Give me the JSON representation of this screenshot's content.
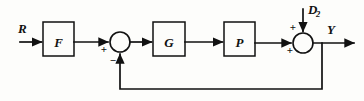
{
  "diagram": {
    "kind": "control-system-block-diagram",
    "background_color": "#fdfdfb",
    "line_color": "#111111",
    "signals": {
      "input_label": "R",
      "output_label": "Y",
      "disturbance_label": "D",
      "disturbance_subscript": "2"
    },
    "blocks": [
      {
        "id": "F",
        "label": "F",
        "x": 43,
        "y": 22,
        "w": 31,
        "h": 34
      },
      {
        "id": "G",
        "label": "G",
        "x": 153,
        "y": 22,
        "w": 32,
        "h": 34
      },
      {
        "id": "P",
        "label": "P",
        "x": 224,
        "y": 22,
        "w": 31,
        "h": 34
      }
    ],
    "summing_junctions": [
      {
        "id": "sum1",
        "cx": 120,
        "cy": 42,
        "r": 10,
        "left_sign": "+",
        "bottom_sign": "−"
      },
      {
        "id": "sum2",
        "cx": 303,
        "cy": 43,
        "r": 10,
        "left_sign": "+",
        "top_sign": "+"
      }
    ],
    "feedback": {
      "type": "unity",
      "tap_x": 322,
      "bottom_y": 89
    }
  }
}
